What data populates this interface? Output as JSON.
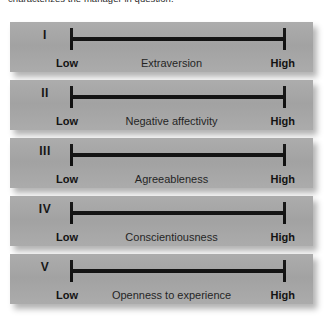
{
  "header": {
    "clipped_text": "characterizes the manager in question."
  },
  "colors": {
    "panel_background": "#a8a8a8",
    "page_background": "#ffffff",
    "line": "#111111",
    "anchor_text": "#0d0d0d",
    "trait_text": "#1c1c1c"
  },
  "scales": [
    {
      "numeral": "I",
      "trait": "Extraversion",
      "low_label": "Low",
      "high_label": "High"
    },
    {
      "numeral": "II",
      "trait": "Negative affectivity",
      "low_label": "Low",
      "high_label": "High"
    },
    {
      "numeral": "III",
      "trait": "Agreeableness",
      "low_label": "Low",
      "high_label": "High"
    },
    {
      "numeral": "IV",
      "trait": "Conscientiousness",
      "low_label": "Low",
      "high_label": "High"
    },
    {
      "numeral": "V",
      "trait": "Openness to experience",
      "low_label": "Low",
      "high_label": "High"
    }
  ]
}
